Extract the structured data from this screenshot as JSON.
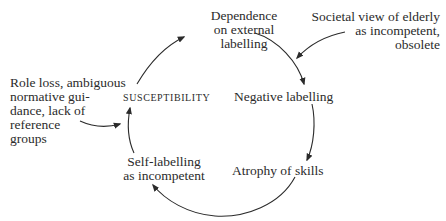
{
  "diagram": {
    "type": "cycle",
    "colors": {
      "text": "#2b2b2b",
      "arrow": "#2b2b2b",
      "background": "#ffffff"
    },
    "nodes": {
      "dependence": {
        "lines": [
          "Dependence",
          "on external",
          "labelling"
        ]
      },
      "societal_view": {
        "lines": [
          "Societal view of elderly",
          "as incompetent,",
          "obsolete"
        ]
      },
      "role_loss": {
        "lines": [
          "Role loss, ambiguous",
          "normative gui-",
          "dance, lack of",
          "reference",
          "groups"
        ]
      },
      "susceptibility": {
        "label": "Susceptibility"
      },
      "negative_labelling": {
        "label": "Negative labelling"
      },
      "self_labelling": {
        "lines": [
          "Self-labelling",
          "as incompetent"
        ]
      },
      "atrophy": {
        "label": "Atrophy of skills"
      }
    },
    "edges": [
      {
        "from": "Susceptibility",
        "to": "Dependence on external labelling"
      },
      {
        "from": "Dependence on external labelling",
        "to": "Negative labelling"
      },
      {
        "from": "Societal view of elderly as incompetent, obsolete",
        "to": "Negative labelling"
      },
      {
        "from": "Negative labelling",
        "to": "Atrophy of skills"
      },
      {
        "from": "Atrophy of skills",
        "to": "Self-labelling as incompetent"
      },
      {
        "from": "Self-labelling as incompetent",
        "to": "Susceptibility"
      },
      {
        "from": "Role loss, ambiguous normative guidance, lack of reference groups",
        "to": "Susceptibility"
      }
    ]
  }
}
